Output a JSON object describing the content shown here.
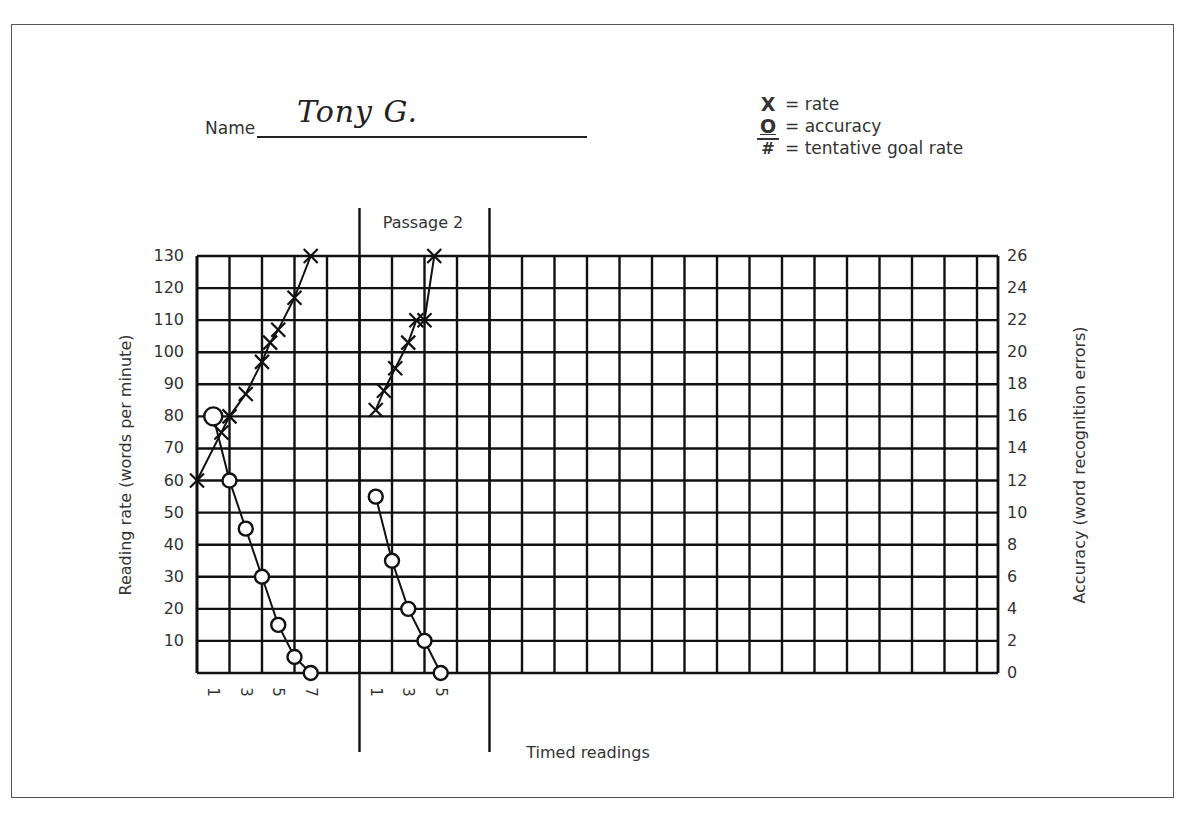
{
  "form": {
    "name_label": "Name",
    "name_value": "Tony G."
  },
  "legend": {
    "items": [
      {
        "symbol": "X",
        "label": "= rate",
        "icon": "x-mark-icon"
      },
      {
        "symbol": "O",
        "label": "= accuracy",
        "icon": "circle-icon"
      },
      {
        "symbol": "#",
        "label": "= tentative goal rate",
        "icon": "hash-icon"
      }
    ]
  },
  "chart_data": {
    "type": "line",
    "title": "",
    "xlabel": "Timed readings",
    "ylabel": "Reading rate (words per minute)",
    "y2label": "Accuracy (word recognition errors)",
    "ylim": [
      0,
      130
    ],
    "y2lim": [
      0,
      26
    ],
    "y_ticks": [
      10,
      20,
      30,
      40,
      50,
      60,
      70,
      80,
      90,
      100,
      110,
      120,
      130
    ],
    "y2_ticks": [
      0,
      2,
      4,
      6,
      8,
      10,
      12,
      14,
      16,
      18,
      20,
      22,
      24,
      26
    ],
    "grid": true,
    "legend_position": "top-right",
    "sections": [
      {
        "name": "Passage 1",
        "x_tick_labels": [
          "1",
          "3",
          "5",
          "7"
        ],
        "series": [
          {
            "name": "rate",
            "marker": "x",
            "x": [
              0,
              1.5,
              2,
              3,
              4,
              4.5,
              5,
              6,
              7
            ],
            "values": [
              60,
              75,
              80,
              87,
              97,
              103,
              107,
              117,
              130
            ]
          },
          {
            "name": "accuracy",
            "marker": "o",
            "axis": "right",
            "x": [
              1,
              2,
              3,
              4,
              5,
              6,
              7
            ],
            "values": [
              16,
              12,
              9,
              6,
              3,
              1,
              0
            ]
          }
        ]
      },
      {
        "name": "Passage 2",
        "label": "Passage 2",
        "x_tick_labels": [
          "1",
          "3",
          "5"
        ],
        "series": [
          {
            "name": "rate",
            "marker": "x",
            "x": [
              1,
              1.5,
              2.2,
              3,
              3.5,
              4,
              4.6
            ],
            "values": [
              82,
              88,
              95,
              103,
              110,
              110,
              130
            ]
          },
          {
            "name": "accuracy",
            "marker": "o",
            "axis": "right",
            "x": [
              1,
              2,
              3,
              4,
              5
            ],
            "values": [
              11,
              7,
              4,
              2,
              0
            ]
          }
        ]
      }
    ],
    "goal_rate": null
  },
  "labels": {
    "passage2": "Passage 2",
    "x_title": "Timed readings",
    "left_title": "Reading rate (words per minute)",
    "right_title": "Accuracy (word recognition errors)"
  }
}
